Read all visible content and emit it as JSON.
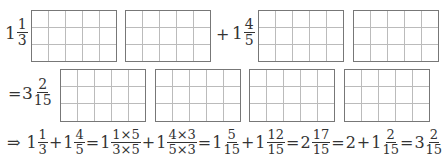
{
  "row1": {
    "first": {
      "whole": "1",
      "num": "1",
      "den": "3"
    },
    "plus": "+",
    "second": {
      "whole": "1",
      "num": "4",
      "den": "5"
    },
    "grids": [
      {
        "cols": 5,
        "rows": 3
      },
      {
        "cols": 5,
        "rows": 3
      },
      {
        "cols": 5,
        "rows": 3
      },
      {
        "cols": 5,
        "rows": 3
      }
    ]
  },
  "row2": {
    "equals": "=",
    "result": {
      "whole": "3",
      "num": "2",
      "den": "15"
    },
    "grids": [
      {
        "cols": 5,
        "rows": 3
      },
      {
        "cols": 5,
        "rows": 3
      },
      {
        "cols": 5,
        "rows": 3
      },
      {
        "cols": 5,
        "rows": 3
      }
    ]
  },
  "equation": {
    "arrow": "⇒",
    "terms": [
      {
        "whole": "1",
        "num": "1",
        "den": "3"
      },
      {
        "op": "+"
      },
      {
        "whole": "1",
        "num": "4",
        "den": "5"
      },
      {
        "op": "="
      },
      {
        "whole": "1",
        "num": "1×5",
        "den": "3×5"
      },
      {
        "op": "+"
      },
      {
        "whole": "1",
        "num": "4×3",
        "den": "5×3"
      },
      {
        "op": "="
      },
      {
        "whole": "1",
        "num": "5",
        "den": "15"
      },
      {
        "op": "+"
      },
      {
        "whole": "1",
        "num": "12",
        "den": "15"
      },
      {
        "op": "="
      },
      {
        "whole": "2",
        "num": "17",
        "den": "15"
      },
      {
        "op": "="
      },
      {
        "text": "2"
      },
      {
        "op": "+"
      },
      {
        "whole": "1",
        "num": "2",
        "den": "15"
      },
      {
        "op": "="
      },
      {
        "whole": "3",
        "num": "2",
        "den": "15"
      }
    ]
  }
}
